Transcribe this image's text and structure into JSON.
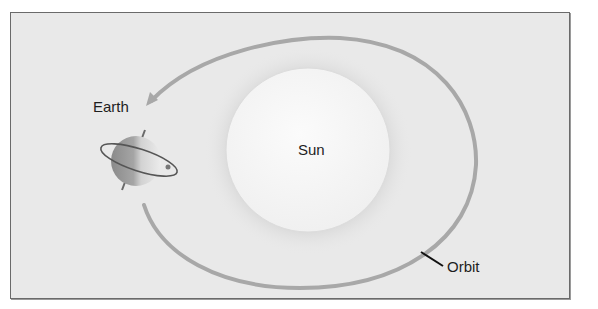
{
  "diagram": {
    "labels": {
      "earth": "Earth",
      "sun": "Sun",
      "orbit": "Orbit"
    },
    "colors": {
      "background": "#e9e9e9",
      "frame_border": "#6a6a6a",
      "orbit": "#a8a8a8",
      "sun": "#f6f6f6",
      "earth_light": "#d8d8d8",
      "earth_dark": "#7a7a7a",
      "leader_line": "#111111"
    }
  }
}
